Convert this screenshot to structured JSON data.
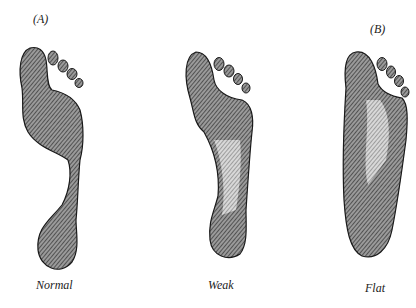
{
  "figure": {
    "panel_labels": {
      "a": "(A)",
      "b": "(B)"
    },
    "footprints": [
      {
        "id": "normal",
        "caption": "Normal"
      },
      {
        "id": "weak",
        "caption": "Weak"
      },
      {
        "id": "flat",
        "caption": "Flat"
      }
    ],
    "colors": {
      "ink": "#1a1a1a",
      "hatch_fill": "#8a8a8a",
      "background": "#ffffff"
    }
  }
}
